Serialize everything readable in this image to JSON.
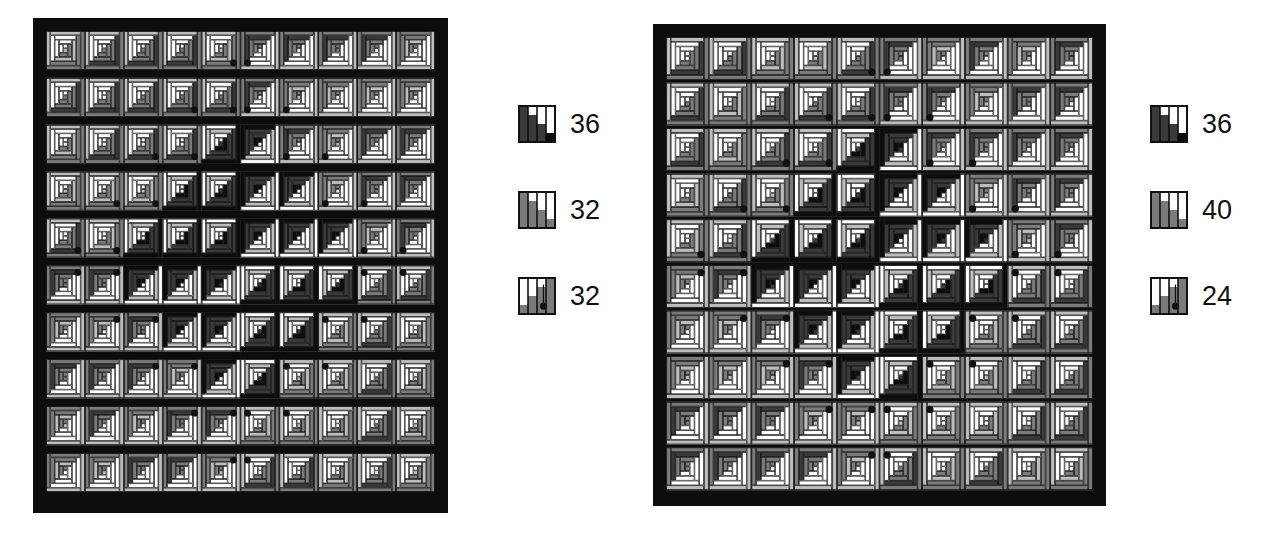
{
  "page": {
    "background": "#ffffff",
    "width": 1280,
    "height": 557
  },
  "palette": {
    "black": "#0d0d0d",
    "dark": "#3a3a3a",
    "mid": "#7b7b7b",
    "light": "#bdbdbd",
    "white": "#ffffff",
    "outline": "#111111",
    "dot": "#111111"
  },
  "figures": [
    {
      "id": "left-quilt-figure",
      "quilt": {
        "name": "quilt-left",
        "x": 33,
        "y": 18,
        "width": 415,
        "height": 495,
        "border": 13,
        "blocks_across": 10,
        "blocks_down": 10,
        "center_dark_ring": 3,
        "dot_ring_radius": 4,
        "seed": 1207
      },
      "legend": {
        "name": "legend-left",
        "x": 518,
        "y": 105,
        "rows": [
          {
            "name": "legend-row-1",
            "value": "36",
            "bars": [
              4,
              3,
              2,
              1
            ],
            "tones": [
              "dark",
              "dark",
              "dark",
              "black"
            ],
            "dot": false
          },
          {
            "name": "legend-row-2",
            "value": "32",
            "bars": [
              4,
              3,
              2,
              1
            ],
            "tones": [
              "mid",
              "mid",
              "mid",
              "mid"
            ],
            "dot": false
          },
          {
            "name": "legend-row-3",
            "value": "32",
            "bars": [
              1,
              2,
              3,
              4
            ],
            "tones": [
              "mid",
              "mid",
              "mid",
              "mid"
            ],
            "dot": true
          }
        ]
      }
    },
    {
      "id": "right-quilt-figure",
      "quilt": {
        "name": "quilt-right",
        "x": 653,
        "y": 24,
        "width": 453,
        "height": 482,
        "border": 13,
        "blocks_across": 10,
        "blocks_down": 10,
        "center_dark_ring": 3,
        "dot_ring_radius": 4,
        "seed": 9931
      },
      "legend": {
        "name": "legend-right",
        "x": 1150,
        "y": 105,
        "rows": [
          {
            "name": "legend-row-1",
            "value": "36",
            "bars": [
              4,
              3,
              2,
              1
            ],
            "tones": [
              "dark",
              "dark",
              "dark",
              "black"
            ],
            "dot": false
          },
          {
            "name": "legend-row-2",
            "value": "40",
            "bars": [
              4,
              3,
              2,
              1
            ],
            "tones": [
              "mid",
              "mid",
              "mid",
              "mid"
            ],
            "dot": false
          },
          {
            "name": "legend-row-3",
            "value": "24",
            "bars": [
              1,
              2,
              3,
              4
            ],
            "tones": [
              "mid",
              "mid",
              "mid",
              "mid"
            ],
            "dot": true
          }
        ]
      }
    }
  ],
  "chart_data": {
    "type": "table",
    "title": "",
    "xlabel": "",
    "ylabel": "",
    "series": [
      {
        "name": "left-quilt-legend",
        "categories": [
          "dark-strip",
          "mid-strip",
          "mid-strip-dot"
        ],
        "values": [
          36,
          32,
          32
        ]
      },
      {
        "name": "right-quilt-legend",
        "categories": [
          "dark-strip",
          "mid-strip",
          "mid-strip-dot"
        ],
        "values": [
          36,
          40,
          24
        ]
      }
    ]
  }
}
